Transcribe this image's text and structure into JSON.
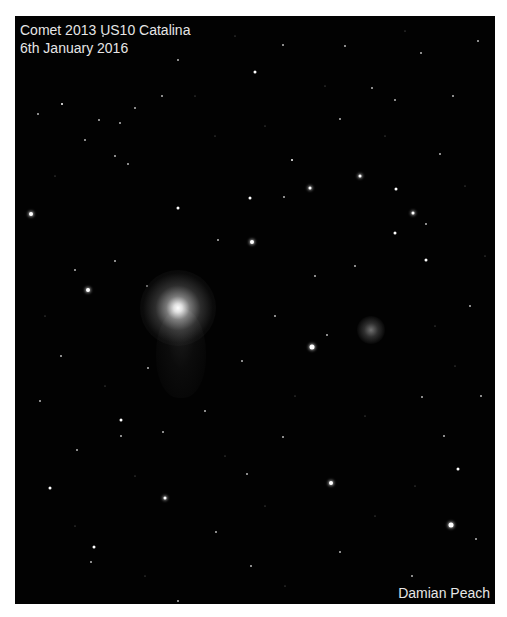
{
  "photo": {
    "title_line1": "Comet 2013 US10 Catalina",
    "title_line2": "6th January 2016",
    "credit": "Damian Peach",
    "background_color": "#020202",
    "subjects": [
      {
        "name": "comet-nucleus",
        "x": 178,
        "y": 308
      },
      {
        "name": "globular-cluster",
        "x": 371,
        "y": 330
      }
    ]
  }
}
